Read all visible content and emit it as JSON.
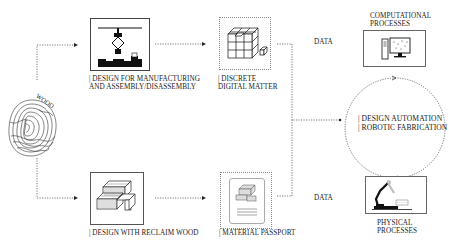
{
  "diagram": {
    "wood": {
      "label": "WOOD"
    },
    "nodes": {
      "dfma": {
        "label_line1": "| DESIGN FOR MANUFACTURING",
        "label_line2": "AND ASSEMBLY/DISASSEMBLY"
      },
      "discrete": {
        "label_line1": "| DISCRETE",
        "label_line2": "DIGITAL MATTER"
      },
      "reclaim": {
        "label_line1": "| DESIGN WITH RECLAIM WOOD"
      },
      "passport": {
        "label_line1": "| MATERIAL PASSPORT"
      },
      "computational": {
        "label_line1": "COMPUTATIONAL",
        "label_line2": "PROCESSES"
      },
      "physical": {
        "label_line1": "PHYSICAL",
        "label_line2": "PROCESSES"
      },
      "cycle": {
        "label_line1": "| DESIGN AUTOMATION",
        "label_line2": "| ROBOTIC FABRICATION"
      }
    },
    "data_labels": {
      "top": "DATA",
      "bottom": "DATA"
    },
    "colors": {
      "line": "#555555",
      "dotted_border": "#888888",
      "icon": "#111111"
    }
  }
}
